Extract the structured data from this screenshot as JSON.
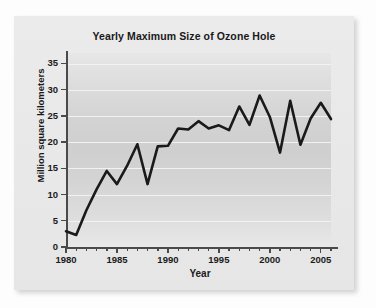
{
  "chart_data": {
    "type": "line",
    "title": "Yearly Maximum Size of Ozone Hole",
    "xlabel": "Year",
    "ylabel": "Million square kilometers",
    "xlim": [
      1980,
      2006
    ],
    "ylim": [
      0,
      37
    ],
    "grid": true,
    "legend": "none",
    "x_ticks": [
      "1980",
      "1985",
      "1990",
      "1995",
      "2000",
      "2005"
    ],
    "x_tick_values": [
      1980,
      1985,
      1990,
      1995,
      2000,
      2005
    ],
    "y_ticks": [
      "0",
      "5",
      "10",
      "15",
      "20",
      "25",
      "30",
      "35"
    ],
    "y_tick_values": [
      0,
      5,
      10,
      15,
      20,
      25,
      30,
      35
    ],
    "minor_x_ticks": [
      1981,
      1982,
      1983,
      1984,
      1986,
      1987,
      1988,
      1989,
      1991,
      1992,
      1993,
      1994,
      1996,
      1997,
      1998,
      1999,
      2001,
      2002,
      2003,
      2004,
      2006
    ],
    "series": [
      {
        "name": "Maximum ozone hole area",
        "x": [
          1980,
          1981,
          1982,
          1983,
          1984,
          1985,
          1986,
          1987,
          1988,
          1989,
          1990,
          1991,
          1992,
          1993,
          1994,
          1995,
          1996,
          1997,
          1998,
          1999,
          2000,
          2001,
          2002,
          2003,
          2004,
          2005,
          2006
        ],
        "values": [
          3.0,
          2.3,
          7.0,
          11.0,
          14.5,
          12.0,
          15.5,
          19.6,
          12.0,
          19.2,
          19.3,
          22.6,
          22.4,
          24.0,
          22.6,
          23.2,
          22.3,
          26.8,
          23.3,
          28.9,
          24.8,
          18.0,
          27.9,
          19.5,
          24.5,
          27.5,
          24.4
        ]
      }
    ],
    "line_color": "#1a1a1a",
    "line_width": 2.6
  },
  "colors": {
    "page_background": "#fdfdfd",
    "panel_background": "#e9e9e9",
    "plot_band": "#d1d1d1",
    "gridline": "#f2f2f2",
    "axis": "#4a4a4a",
    "text": "#19191b"
  }
}
